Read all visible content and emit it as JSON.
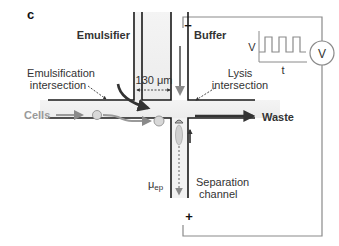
{
  "panel_label": "c",
  "labels": {
    "emulsifier": "Emulsifier",
    "buffer": "Buffer",
    "emulsification_intersection_line1": "Emulsification",
    "emulsification_intersection_line2": "intersection",
    "lysis_intersection_line1": "Lysis",
    "lysis_intersection_line2": "intersection",
    "cells": "Cells",
    "waste": "Waste",
    "separation_channel_line1": "Separation",
    "separation_channel_line2": "channel",
    "mu_ep": "μ",
    "mu_ep_sub": "ep",
    "width_dimension": "130 μm",
    "minus": "−",
    "plus": "+",
    "voltage_axis": "V",
    "time_axis": "t",
    "voltmeter": "V"
  },
  "colors": {
    "channel_wall": "#1a1a1a",
    "dark_arrow": "#333333",
    "gray_arrow": "#8a8a8a",
    "cells_text": "#9a9a9a",
    "circuit_line": "#888888",
    "cell": "#cfcfcf"
  }
}
